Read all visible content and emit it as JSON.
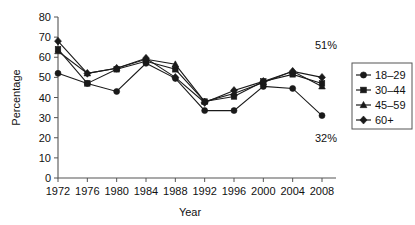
{
  "chart_data": {
    "type": "line",
    "title": "",
    "xlabel": "Year",
    "ylabel": "Percentage",
    "categories": [
      1972,
      1976,
      1980,
      1984,
      1988,
      1992,
      1996,
      2000,
      2004,
      2008
    ],
    "xtick_labels": [
      "1972",
      "1976",
      "1980",
      "1984",
      "1988",
      "1992",
      "1996",
      "2000",
      "2004",
      "2008"
    ],
    "ytick_labels": [
      "0",
      "10",
      "20",
      "30",
      "40",
      "50",
      "60",
      "70",
      "80"
    ],
    "ylim": [
      0,
      80
    ],
    "ytick_step": 10,
    "xlim": [
      1972,
      2008
    ],
    "grid": false,
    "legend_position": "right-outside",
    "series": [
      {
        "name": "18–29",
        "marker": "circle",
        "color": "#1a1a1a",
        "values": [
          52,
          47,
          43,
          57,
          49.5,
          33.5,
          33.5,
          45.5,
          44.5,
          31
        ]
      },
      {
        "name": "30–44",
        "marker": "square",
        "color": "#1a1a1a",
        "values": [
          64,
          47,
          54,
          58,
          54,
          38,
          40.5,
          48,
          51.5,
          47
        ]
      },
      {
        "name": "45–59",
        "marker": "triangle",
        "color": "#1a1a1a",
        "values": [
          63,
          52,
          54.5,
          59,
          56.5,
          38,
          42,
          47.5,
          53,
          45.5
        ]
      },
      {
        "name": "60+",
        "marker": "diamond",
        "color": "#1a1a1a",
        "values": [
          68,
          52,
          54.5,
          59.5,
          50,
          37.5,
          43.5,
          48,
          53,
          50
        ]
      }
    ],
    "annotations": [
      {
        "text": "51%",
        "year": 2008,
        "value": 58,
        "dx": 4,
        "dy": -12
      },
      {
        "text": "32%",
        "year": 2008,
        "value": 24,
        "dx": 4,
        "dy": 12
      }
    ]
  },
  "legend": {
    "entries": [
      {
        "label": "18–29",
        "marker": "circle"
      },
      {
        "label": "30–44",
        "marker": "square"
      },
      {
        "label": "45–59",
        "marker": "triangle"
      },
      {
        "label": "60+",
        "marker": "diamond"
      }
    ]
  }
}
